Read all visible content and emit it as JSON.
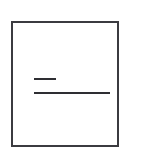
{
  "canvas": {
    "width": 164,
    "height": 153,
    "background_color": "#ffffff"
  },
  "figure": {
    "kind": "line-drawing",
    "description": "Rectangular frame enclosing two horizontal line segments",
    "frame": {
      "label": "rectangle-frame",
      "x": 11,
      "y": 21,
      "width": 108,
      "height": 126,
      "stroke_color": "#3b3b40",
      "stroke_width": 2,
      "fill_color": "#ffffff"
    },
    "strokes": [
      {
        "label": "short-horizontal-line",
        "x": 34,
        "y": 78,
        "width": 22,
        "height": 2,
        "color": "#2e2e33"
      },
      {
        "label": "long-horizontal-line",
        "x": 34,
        "y": 92,
        "width": 76,
        "height": 2,
        "color": "#2e2e33"
      }
    ]
  }
}
